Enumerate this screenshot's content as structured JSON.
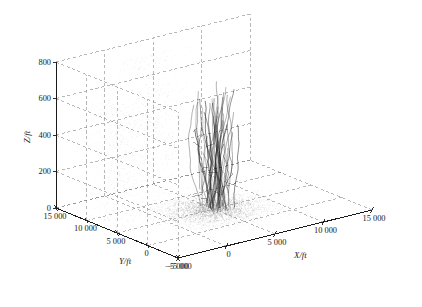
{
  "chart_data": {
    "type": "line",
    "title": "",
    "subtitle": "",
    "projection": "3d",
    "xlabel": "X/ft",
    "ylabel": "Y/ft",
    "zlabel": "Z/ft",
    "xlim": [
      -5000,
      15000
    ],
    "ylim": [
      -5000,
      15000
    ],
    "zlim": [
      0,
      800
    ],
    "xticks": [
      -5000,
      0,
      5000,
      10000,
      15000
    ],
    "yticks": [
      -5000,
      0,
      5000,
      10000,
      15000
    ],
    "zticks": [
      0,
      200,
      400,
      600,
      800
    ],
    "xticklabels": [
      "−5 000",
      "0",
      "5 000",
      "10 000",
      "15 000"
    ],
    "yticklabels": [
      "−5 000",
      "0",
      "5 000",
      "10 000",
      "15 000"
    ],
    "zticklabels": [
      "0",
      "200",
      "400",
      "600",
      "800"
    ],
    "grid": true,
    "gridstyle": "dashed",
    "legend": "none",
    "legend_position": "none",
    "box": true,
    "view_azimuth_deg": -37.5,
    "view_elevation_deg": 30,
    "series": [
      {
        "name": "trajectory-bundle",
        "style": "lines",
        "color": "#1a1a1a",
        "linewidth": 0.5,
        "description": "Dense bundle of near-vertical flight trajectories clustered near X=5 000 ft, Y=5 000 ft spanning Z from 0 to about 700 ft",
        "cluster_center_x": 5000,
        "cluster_center_y": 5000,
        "cluster_spread_x": 900,
        "cluster_spread_y": 900,
        "z_min": 0,
        "z_max": 700,
        "count": 46
      },
      {
        "name": "ground-projection-scatter",
        "style": "dots",
        "color": "#9a9a9a",
        "markersize": 0.6,
        "description": "Stippled dot field projected on the Z=0 floor plane and rear walls",
        "count": 2600
      }
    ]
  },
  "axes": {
    "z": {
      "title": "Z/ft",
      "ticks": [
        "800",
        "600",
        "400",
        "200",
        "0"
      ]
    },
    "y": {
      "title": "Y/ft",
      "ticks": [
        "15 000",
        "10 000",
        "5 000",
        "0",
        "−5 000"
      ]
    },
    "x": {
      "title": "X/ft",
      "ticks": [
        "−5 000",
        "0",
        "5 000",
        "10 000",
        "15 000"
      ]
    }
  },
  "colors": {
    "background": "#ffffff",
    "axis_line": "#1a1a1a",
    "grid_line": "#7d7d7d",
    "data_line": "#1a1a1a",
    "scatter_dot": "#a0a0a0",
    "text": "#1a1a1a"
  }
}
